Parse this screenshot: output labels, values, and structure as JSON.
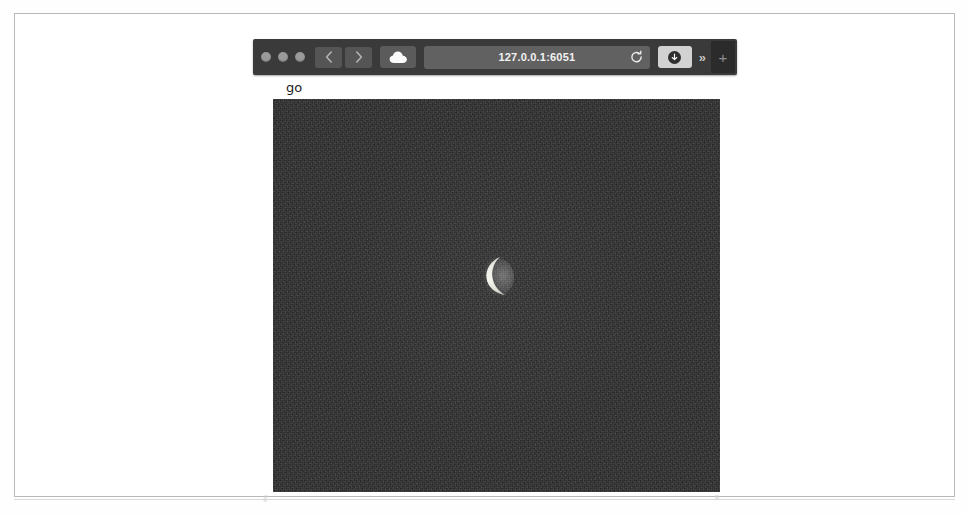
{
  "browser": {
    "window_controls": [
      "close",
      "minimize",
      "zoom"
    ],
    "back_label": "‹",
    "forward_label": "›",
    "cloud_icon": "cloud-icon",
    "address": {
      "url": "127.0.0.1:6051",
      "placeholder": "Search or enter website name",
      "reload_icon": "reload-icon"
    },
    "share_icon": "download-icon",
    "overflow_label": "»",
    "new_tab_label": "+"
  },
  "page": {
    "label": "go",
    "image": {
      "name": "night-sky-crescent-moon",
      "alt": "Thin waxing crescent moon against a dark grainy night sky",
      "background_color": "#2f2f2f",
      "moon_color": "#e9e9e2"
    }
  }
}
